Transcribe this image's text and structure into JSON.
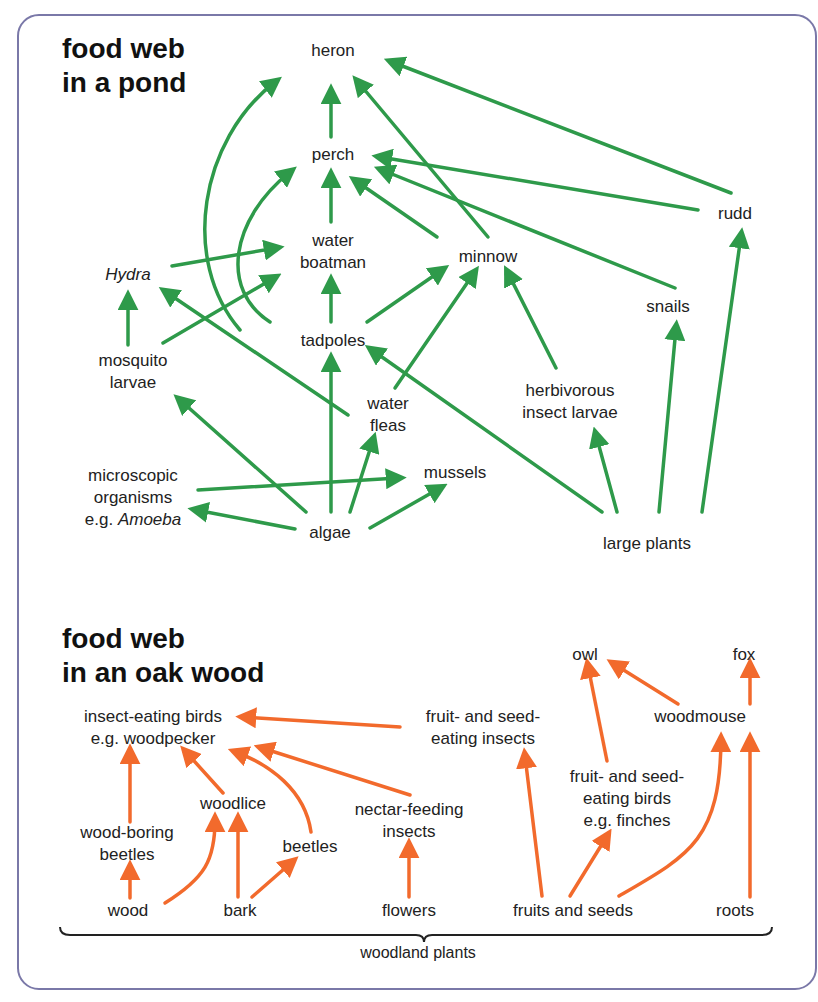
{
  "colors": {
    "frame": "#7a78a8",
    "pond_arrow": "#2e9a4a",
    "wood_arrow": "#f26a2c",
    "text": "#222222"
  },
  "pond": {
    "title": [
      "food web",
      "in a pond"
    ],
    "nodes": {
      "heron": {
        "label": "heron",
        "x": 333,
        "y": 40
      },
      "perch": {
        "label": "perch",
        "x": 333,
        "y": 144
      },
      "rudd": {
        "label": "rudd",
        "x": 735,
        "y": 203
      },
      "water_boatman": {
        "label": "water\nboatman",
        "x": 333,
        "y": 230
      },
      "minnow": {
        "label": "minnow",
        "x": 488,
        "y": 246
      },
      "hydra": {
        "label": "Hydra",
        "x": 128,
        "y": 264,
        "italic": true
      },
      "snails": {
        "label": "snails",
        "x": 668,
        "y": 296
      },
      "tadpoles": {
        "label": "tadpoles",
        "x": 333,
        "y": 330
      },
      "mosquito_larvae": {
        "label": "mosquito\nlarvae",
        "x": 133,
        "y": 350
      },
      "herbivorous_insect_larvae": {
        "label": "herbivorous\ninsect larvae",
        "x": 570,
        "y": 380
      },
      "water_fleas": {
        "label": "water\nfleas",
        "x": 388,
        "y": 393
      },
      "mussels": {
        "label": "mussels",
        "x": 455,
        "y": 462
      },
      "microscopic": {
        "label": "microscopic\norganisms\ne.g. Amoeba",
        "x": 133,
        "y": 465
      },
      "algae": {
        "label": "algae",
        "x": 330,
        "y": 522
      },
      "large_plants": {
        "label": "large plants",
        "x": 647,
        "y": 533
      }
    },
    "edges": [
      {
        "from": "perch",
        "to": "heron",
        "d": "M331,137 L331,92"
      },
      {
        "from": "rudd",
        "to": "heron",
        "d": "M731,193 L392,62"
      },
      {
        "from": "minnow",
        "to": "heron",
        "d": "M488,237 L358,82"
      },
      {
        "from": "tadpoles",
        "to": "heron",
        "d": "M240,330 C180,260 200,140 275,82"
      },
      {
        "from": "water_boatman",
        "to": "perch",
        "d": "M331,222 L331,176"
      },
      {
        "from": "rudd",
        "to": "perch",
        "d": "M698,210 L380,157"
      },
      {
        "from": "snails",
        "to": "perch",
        "d": "M675,288 L382,170"
      },
      {
        "from": "minnow",
        "to": "perch",
        "d": "M437,237 L356,181"
      },
      {
        "from": "tadpoles",
        "to": "perch",
        "d": "M270,322 C220,290 230,220 290,172"
      },
      {
        "from": "hydra",
        "to": "water_boatman",
        "d": "M172,266 L276,248"
      },
      {
        "from": "mosquito_larvae",
        "to": "water_boatman",
        "d": "M163,343 L274,278"
      },
      {
        "from": "tadpoles",
        "to": "water_boatman",
        "d": "M331,322 L331,282"
      },
      {
        "from": "tadpoles",
        "to": "minnow",
        "d": "M367,322 L442,270"
      },
      {
        "from": "water_fleas",
        "to": "minnow",
        "d": "M395,388 L474,273"
      },
      {
        "from": "herbivorous_insect_larvae",
        "to": "minnow",
        "d": "M556,368 L508,273"
      },
      {
        "from": "mosquito_larvae",
        "to": "hydra",
        "d": "M128,345 L128,298"
      },
      {
        "from": "water_fleas",
        "to": "hydra",
        "d": "M348,415 L166,292"
      },
      {
        "from": "algae",
        "to": "tadpoles",
        "d": "M331,512 L331,360"
      },
      {
        "from": "large_plants",
        "to": "tadpoles",
        "d": "M602,512 L372,350"
      },
      {
        "from": "large_plants",
        "to": "herbivorous_insect_larvae",
        "d": "M617,512 L596,435"
      },
      {
        "from": "large_plants",
        "to": "snails",
        "d": "M659,512 L676,328"
      },
      {
        "from": "large_plants",
        "to": "rudd",
        "d": "M702,512 L741,236"
      },
      {
        "from": "algae",
        "to": "mosquito_larvae",
        "d": "M306,512 L180,400"
      },
      {
        "from": "algae",
        "to": "water_fleas",
        "d": "M350,512 L373,440"
      },
      {
        "from": "algae",
        "to": "mussels",
        "d": "M370,528 L440,488"
      },
      {
        "from": "algae",
        "to": "microscopic",
        "d": "M295,529 L196,510"
      },
      {
        "from": "microscopic",
        "to": "mussels",
        "d": "M198,490 L398,478"
      }
    ]
  },
  "wood": {
    "title": [
      "food web",
      "in an oak wood"
    ],
    "nodes": {
      "owl": {
        "label": "owl",
        "x": 585,
        "y": 644
      },
      "fox": {
        "label": "fox",
        "x": 744,
        "y": 644
      },
      "insect_eating_birds": {
        "label": "insect-eating birds\ne.g. woodpecker",
        "x": 153,
        "y": 706
      },
      "fruit_seed_insects": {
        "label": "fruit- and seed-\neating insects",
        "x": 483,
        "y": 706
      },
      "woodmouse": {
        "label": "woodmouse",
        "x": 700,
        "y": 706
      },
      "woodlice": {
        "label": "woodlice",
        "x": 233,
        "y": 793
      },
      "fruit_seed_birds": {
        "label": "fruit- and seed-\neating birds\ne.g. finches",
        "x": 627,
        "y": 766
      },
      "nectar_insects": {
        "label": "nectar-feeding\ninsects",
        "x": 409,
        "y": 799
      },
      "wood_boring_beetles": {
        "label": "wood-boring\nbeetles",
        "x": 127,
        "y": 822
      },
      "beetles": {
        "label": "beetles",
        "x": 310,
        "y": 836
      },
      "wood": {
        "label": "wood",
        "x": 128,
        "y": 900
      },
      "bark": {
        "label": "bark",
        "x": 240,
        "y": 900
      },
      "flowers": {
        "label": "flowers",
        "x": 409,
        "y": 900
      },
      "fruits_seeds": {
        "label": "fruits and seeds",
        "x": 573,
        "y": 900
      },
      "roots": {
        "label": "roots",
        "x": 735,
        "y": 900
      }
    },
    "edges": [
      {
        "from": "fruit_seed_insects",
        "to": "insect_eating_birds",
        "d": "M400,727 L244,717"
      },
      {
        "from": "nectar_insects",
        "to": "insect_eating_birds",
        "d": "M410,795 L262,748"
      },
      {
        "from": "wood_boring_beetles",
        "to": "insect_eating_birds",
        "d": "M130,822 L130,752"
      },
      {
        "from": "woodlice",
        "to": "insect_eating_birds",
        "d": "M223,793 L186,752"
      },
      {
        "from": "beetles",
        "to": "insect_eating_birds",
        "d": "M311,832 C305,790 270,765 236,752"
      },
      {
        "from": "wood",
        "to": "wood_boring_beetles",
        "d": "M130,898 L130,868"
      },
      {
        "from": "wood",
        "to": "woodlice",
        "d": "M165,903 C205,878 215,860 215,820"
      },
      {
        "from": "bark",
        "to": "woodlice",
        "d": "M238,897 L238,820"
      },
      {
        "from": "bark",
        "to": "beetles",
        "d": "M252,897 L292,862"
      },
      {
        "from": "flowers",
        "to": "nectar_insects",
        "d": "M409,897 L409,846"
      },
      {
        "from": "fruits_seeds",
        "to": "fruit_seed_insects",
        "d": "M542,896 L525,756"
      },
      {
        "from": "fruits_seeds",
        "to": "fruit_seed_birds",
        "d": "M570,896 L607,836"
      },
      {
        "from": "fruits_seeds",
        "to": "woodmouse",
        "d": "M619,896 C690,855 720,840 721,740"
      },
      {
        "from": "fruit_seed_birds",
        "to": "owl",
        "d": "M607,761 L588,666"
      },
      {
        "from": "woodmouse",
        "to": "owl",
        "d": "M678,704 L614,664"
      },
      {
        "from": "woodmouse",
        "to": "fox",
        "d": "M750,704 L750,666"
      },
      {
        "from": "roots",
        "to": "woodmouse",
        "d": "M750,897 L750,740"
      }
    ],
    "brace": {
      "label": "woodland plants",
      "x1": 60,
      "x2": 772,
      "y": 935,
      "label_x": 418,
      "label_y": 944
    }
  }
}
